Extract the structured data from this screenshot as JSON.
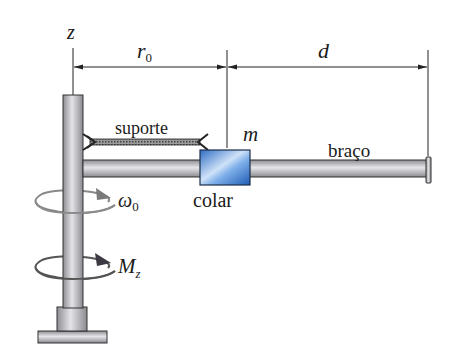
{
  "diagram": {
    "axis": {
      "label": "z"
    },
    "dimensions": [
      {
        "id": "r0",
        "symbol": "r",
        "subscript": "0"
      },
      {
        "id": "d",
        "symbol": "d"
      }
    ],
    "components": {
      "support": {
        "label": "suporte"
      },
      "mass": {
        "label": "m"
      },
      "arm": {
        "label": "braço"
      },
      "collar": {
        "label": "colar"
      }
    },
    "rotation": {
      "angular_velocity": {
        "symbol": "ω",
        "subscript": "0"
      },
      "moment": {
        "symbol": "M",
        "subscript": "z"
      }
    },
    "colors": {
      "collar_blue": "#3f7fd0",
      "collar_light": "#b8d4f4",
      "metal_gray": "#b9b9bd",
      "metal_dark": "#6d6d72",
      "outline": "#2a2a2a",
      "arrow_gray": "#858585"
    }
  }
}
